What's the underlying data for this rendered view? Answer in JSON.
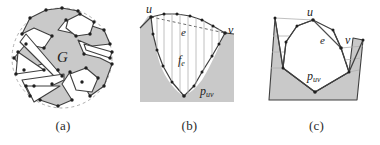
{
  "figure": {
    "kind": "three-panel-geometry-figure",
    "background_color": "#ffffff",
    "fill_gray": "#c9c9c9",
    "stroke_dark": "#3a3a3a",
    "stroke_light": "#9a9a9a",
    "vertex_color": "#242424",
    "panels": [
      {
        "id": "a",
        "caption": "(a)",
        "labels": [
          {
            "name": "graph-label-G",
            "text": "G",
            "x": 57,
            "y": 62,
            "size": 15,
            "style": "italic"
          }
        ]
      },
      {
        "id": "b",
        "caption": "(b)",
        "labels": [
          {
            "name": "vertex-label-u",
            "text": "u",
            "x": 27,
            "y": 15,
            "size": 12,
            "style": "italic"
          },
          {
            "name": "vertex-label-v",
            "text": "v",
            "x": 97,
            "y": 36,
            "size": 12,
            "style": "italic"
          },
          {
            "name": "edge-label-e",
            "text": "e",
            "x": 58,
            "y": 36,
            "size": 11,
            "style": "italic"
          },
          {
            "name": "face-label-fe",
            "text": "f",
            "sub": "e",
            "x": 54,
            "y": 64,
            "size": 12,
            "style": "italic"
          },
          {
            "name": "path-label-puv",
            "text": "p",
            "sub": "uv",
            "x": 78,
            "y": 97,
            "size": 12,
            "style": "italic"
          }
        ]
      },
      {
        "id": "c",
        "caption": "(c)",
        "labels": [
          {
            "name": "vertex-label-u",
            "text": "u",
            "x": 57,
            "y": 20,
            "size": 12,
            "style": "italic"
          },
          {
            "name": "vertex-label-v",
            "text": "v",
            "x": 94,
            "y": 44,
            "size": 12,
            "style": "italic"
          },
          {
            "name": "edge-label-e",
            "text": "e",
            "x": 70,
            "y": 42,
            "size": 11,
            "style": "italic"
          },
          {
            "name": "path-label-puv",
            "text": "p",
            "sub": "uv",
            "x": 60,
            "y": 80,
            "size": 12,
            "style": "italic"
          }
        ]
      }
    ],
    "captions": {
      "a": "(a)",
      "b": "(b)",
      "c": "(c)"
    }
  }
}
